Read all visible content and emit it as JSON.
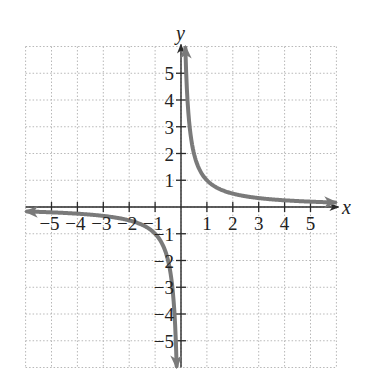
{
  "chart_data": {
    "type": "line",
    "title": "",
    "function": "y = 1/x",
    "xlabel": "x",
    "ylabel": "y",
    "xlim": [
      -6,
      6
    ],
    "ylim": [
      -6,
      6
    ],
    "grid": true,
    "x_ticks": [
      -5,
      -4,
      -3,
      -2,
      -1,
      1,
      2,
      3,
      4,
      5
    ],
    "y_ticks": [
      -5,
      -4,
      -3,
      -2,
      -1,
      1,
      2,
      3,
      4,
      5
    ],
    "x_tick_labels": [
      "−5",
      "−4",
      "−3",
      "−2",
      "−1",
      "1",
      "2",
      "3",
      "4",
      "5"
    ],
    "y_tick_labels": [
      "−5",
      "−4",
      "−3",
      "−2",
      "−1",
      "1",
      "2",
      "3",
      "4",
      "5"
    ],
    "series": [
      {
        "name": "right branch",
        "x": [
          0.17,
          0.2,
          0.25,
          0.333,
          0.5,
          1,
          2,
          3,
          4,
          5,
          6
        ],
        "y": [
          5.9,
          5,
          4,
          3,
          2,
          1,
          0.5,
          0.333,
          0.25,
          0.2,
          0.167
        ]
      },
      {
        "name": "left branch",
        "x": [
          -6,
          -5,
          -4,
          -3,
          -2,
          -1,
          -0.5,
          -0.333,
          -0.25,
          -0.2,
          -0.17
        ],
        "y": [
          -0.167,
          -0.2,
          -0.25,
          -0.333,
          -0.5,
          -1,
          -2,
          -3,
          -4,
          -5,
          -5.9
        ]
      }
    ],
    "colors": {
      "curve": "#7a7a7a",
      "axis": "#2a2a2a",
      "grid": "#b8b8b8"
    }
  }
}
